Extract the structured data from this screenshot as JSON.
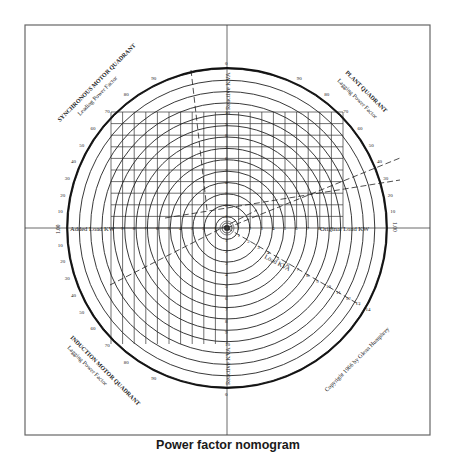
{
  "caption": "Power factor nomogram",
  "quadrants": {
    "top_left": {
      "title": "SYNCHRONOUS MOTOR QUADRANT",
      "subtitle": "Leading Power Factor"
    },
    "top_right": {
      "title": "PLANT QUADRANT",
      "subtitle": "Lagging Power Factor"
    },
    "bottom_left": {
      "title": "INDUCTION MOTOR QUADRANT",
      "subtitle": "Lagging Power Factor"
    }
  },
  "axes": {
    "vertical_label": "Reactive KVA",
    "left_label": "Added Load KW",
    "right_label": "Original Load KW",
    "diagonal_label": "Load KVA",
    "left_end": "1.00",
    "right_end": "1.00"
  },
  "copyright": "Copyright 1966 by Glenn Humphrey",
  "colors": {
    "ink": "#222222",
    "frame": "#666666",
    "background": "#ffffff"
  },
  "chart_data": {
    "type": "nomogram",
    "title": "Power factor nomogram",
    "axis_ticks": {
      "vertical": [
        1,
        2,
        3,
        4,
        5,
        6,
        7,
        8,
        9,
        10
      ],
      "left_horizontal": [
        1,
        2,
        3,
        4,
        5,
        6,
        7,
        8,
        9
      ],
      "right_horizontal": [
        1,
        2,
        3,
        4,
        5,
        6,
        7,
        8,
        9
      ],
      "load_kva_diagonal": [
        1,
        2,
        3,
        4,
        5,
        6,
        7,
        8,
        9,
        10,
        11,
        12,
        13,
        14
      ]
    },
    "power_factor_scale_upper": [
      10,
      20,
      30,
      40,
      50,
      60,
      70,
      80,
      90
    ],
    "power_factor_scale_lower": [
      10,
      20,
      30,
      40,
      50,
      60,
      70,
      80,
      90
    ],
    "concentric_circles": 14,
    "grid_divisions": 10,
    "axis_ends": {
      "left": "1.00",
      "right": "1.00",
      "top": "0",
      "bottom": "0"
    }
  }
}
